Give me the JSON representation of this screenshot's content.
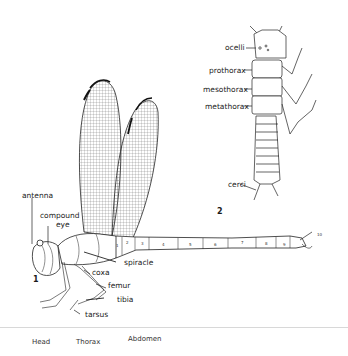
{
  "figure": {
    "adult": {
      "figure_number": "1",
      "labels": {
        "antenna": "antenna",
        "compound_eye_line1": "compound",
        "compound_eye_line2": "eye",
        "spiracle": "spiracle",
        "coxa": "coxa",
        "femur": "femur",
        "tibia": "tibia",
        "tarsus": "tarsus"
      },
      "abdominal_segments": [
        "1",
        "2",
        "3",
        "4",
        "5",
        "6",
        "7",
        "8",
        "9",
        "10"
      ]
    },
    "nymph": {
      "figure_number": "2",
      "labels": {
        "ocelli": "ocelli",
        "prothorax": "prothorax",
        "mesothorax": "mesothorax",
        "metathorax": "metathorax",
        "cerci": "cerci"
      }
    },
    "body_regions": [
      "Head",
      "Thorax",
      "Abdomen"
    ]
  }
}
